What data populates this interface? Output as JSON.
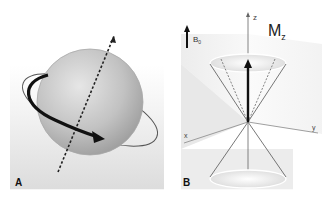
{
  "figure": {
    "panels": [
      {
        "id": "A",
        "label": "A",
        "description": "Spinning proton sphere with dashed rotation axis and curved rotation arrow"
      },
      {
        "id": "B",
        "label": "B",
        "field_label": "B",
        "field_subscript": "0",
        "magnetization_label": "M",
        "magnetization_subscript": "z",
        "axes": {
          "z": "z",
          "x": "x",
          "y": "y"
        },
        "description": "Precession cones of spins about z-axis with net magnetization Mz"
      }
    ]
  }
}
